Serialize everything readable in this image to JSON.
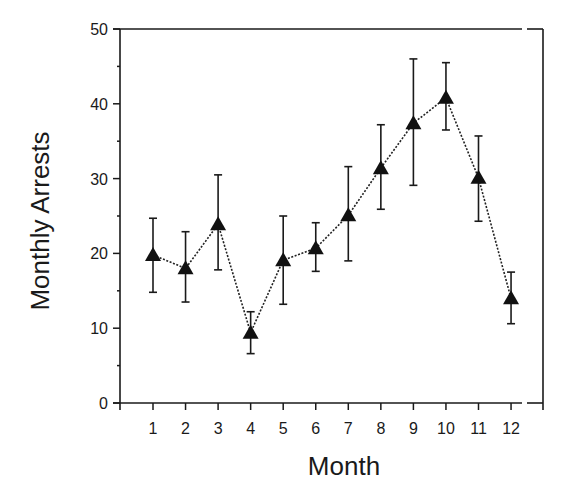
{
  "chart_data": {
    "type": "line",
    "title": "",
    "xlabel": "Month",
    "ylabel": "Monthly Arrests",
    "x": [
      1,
      2,
      3,
      4,
      5,
      6,
      7,
      8,
      9,
      10,
      11,
      12
    ],
    "x_tick_labels": [
      "1",
      "2",
      "3",
      "4",
      "5",
      "6",
      "7",
      "8",
      "9",
      "10",
      "11",
      "12"
    ],
    "y_ticks": [
      0,
      10,
      20,
      30,
      40,
      50
    ],
    "y_tick_labels": [
      "0",
      "10",
      "20",
      "30",
      "40",
      "50"
    ],
    "y_minor_ticks": [
      5,
      15,
      25,
      35,
      45
    ],
    "ylim": [
      0,
      50
    ],
    "xlim": [
      0,
      13
    ],
    "grid": false,
    "legend": null,
    "series": [
      {
        "name": "Monthly Arrests",
        "marker": "filled-triangle",
        "line_style": "dotted",
        "color": "#111111",
        "values": [
          19.8,
          18.0,
          23.9,
          9.4,
          19.1,
          20.7,
          25.1,
          31.4,
          37.4,
          40.8,
          30.1,
          14.0
        ],
        "error_upper": [
          24.7,
          22.9,
          30.5,
          12.2,
          25.0,
          24.1,
          31.6,
          37.2,
          46.0,
          45.5,
          35.7,
          17.5
        ],
        "error_lower": [
          14.8,
          13.5,
          17.8,
          6.6,
          13.2,
          17.6,
          19.0,
          25.9,
          29.1,
          36.5,
          24.3,
          10.6
        ]
      }
    ]
  },
  "axes": {
    "x_title": "Month",
    "y_title": "Monthly Arrests"
  }
}
